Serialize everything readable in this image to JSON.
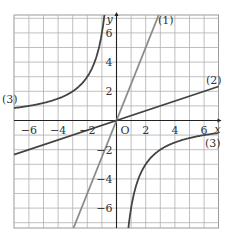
{
  "chart_data": {
    "type": "line",
    "title": "",
    "xlabel": "x",
    "ylabel": "y",
    "origin_label": "O",
    "xlim": [
      -7,
      7
    ],
    "ylim": [
      -7.3,
      7.3
    ],
    "grid": true,
    "grid_step": 1,
    "x_ticks": [
      -6,
      -4,
      -2,
      2,
      4,
      6
    ],
    "x_tick_labels": [
      "−6",
      "−4",
      "−2",
      "2",
      "4",
      "6"
    ],
    "y_ticks": [
      6,
      4,
      2,
      -2,
      -4,
      -6
    ],
    "y_tick_labels": [
      "6",
      "4",
      "2",
      "2",
      "4",
      "6"
    ],
    "series": [
      {
        "name": "(1)",
        "equation": "y = 5x/2",
        "kind": "line",
        "slope": 2.5,
        "color": "#8a8a8a"
      },
      {
        "name": "(2)",
        "equation": "y = x/3",
        "kind": "line",
        "slope": 0.3333,
        "color": "#444444"
      },
      {
        "name": "(3)",
        "equation": "y = -6/x",
        "kind": "hyperbola",
        "k": -6,
        "color": "#444444"
      }
    ],
    "labels": [
      {
        "text": "(1)",
        "x": 3.0,
        "y": 7.0
      },
      {
        "text": "(2)",
        "x": 6.3,
        "y": 2.9
      },
      {
        "text": "(3)",
        "x": -7.0,
        "y": 1.5
      },
      {
        "text": "(3)",
        "x": 6.3,
        "y": -1.9
      }
    ]
  }
}
